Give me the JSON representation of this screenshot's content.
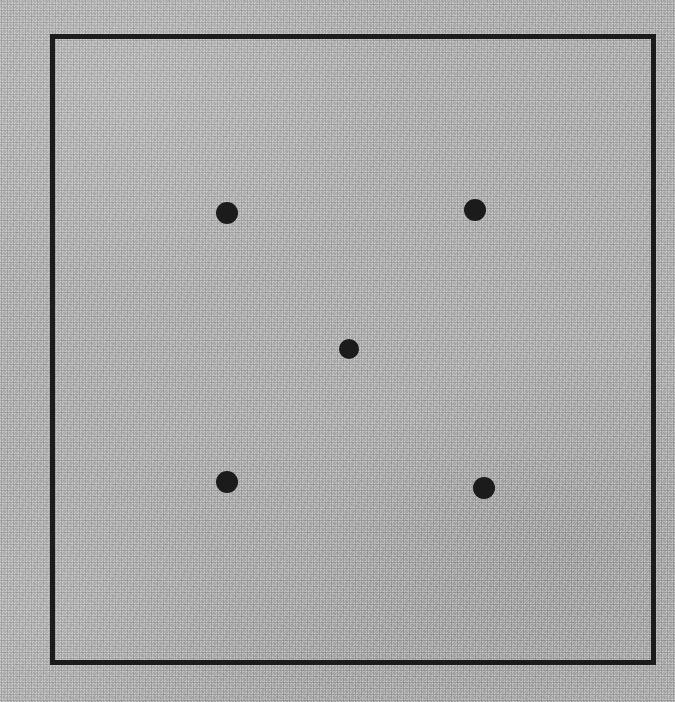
{
  "figure": {
    "canvas": {
      "width": 675,
      "height": 702,
      "background_color": "#adadad",
      "medium": "halftone-dithered photocopy scan"
    },
    "frame": {
      "name": "square-frame",
      "shape": "square",
      "stroke_color": "#1c1c1c",
      "stroke_width": 5,
      "fill": "none",
      "x": 52,
      "y": 36,
      "width": 601,
      "height": 626
    },
    "dots": {
      "count": 5,
      "arrangement": "quincunx",
      "fill_color": "#1b1b1b",
      "radius": 11,
      "items": [
        {
          "id": "dot-top-left",
          "label": "top-left dot",
          "cx": 227,
          "cy": 213,
          "r": 11
        },
        {
          "id": "dot-top-right",
          "label": "top-right dot",
          "cx": 475,
          "cy": 210,
          "r": 11
        },
        {
          "id": "dot-center",
          "label": "center dot",
          "cx": 349,
          "cy": 349,
          "r": 10
        },
        {
          "id": "dot-bottom-left",
          "label": "bottom-left dot",
          "cx": 227,
          "cy": 482,
          "r": 11
        },
        {
          "id": "dot-bottom-right",
          "label": "bottom-right dot",
          "cx": 484,
          "cy": 488,
          "r": 11
        }
      ]
    }
  },
  "chart_data": {
    "type": "scatter",
    "title": "",
    "xlabel": "",
    "ylabel": "",
    "xlim": [
      52,
      653
    ],
    "ylim": [
      36,
      662
    ],
    "grid": false,
    "legend": null,
    "marker": "circle",
    "marker_color": "#1b1b1b",
    "marker_size": 22,
    "x": [
      227,
      475,
      349,
      227,
      484
    ],
    "y": [
      213,
      210,
      349,
      482,
      488
    ],
    "point_labels": [
      "top-left",
      "top-right",
      "center",
      "bottom-left",
      "bottom-right"
    ],
    "annotations": [
      {
        "type": "rectangle",
        "x": 52,
        "y": 36,
        "width": 601,
        "height": 626,
        "edgecolor": "#1c1c1c",
        "linewidth": 5,
        "facecolor": "none"
      }
    ]
  }
}
